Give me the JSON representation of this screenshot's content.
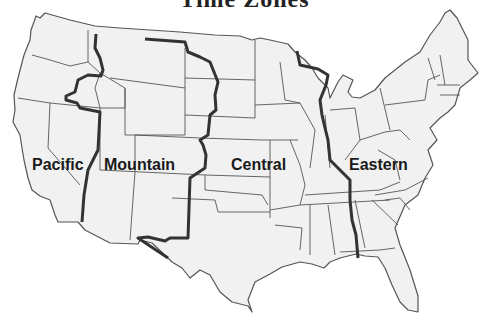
{
  "title": "Time Zones",
  "map": {
    "region": "Contiguous United States",
    "colors": {
      "land": "#f1f1f1",
      "state_border": "#555555",
      "zone_border": "#333333",
      "background": "#ffffff"
    },
    "zones": [
      {
        "id": "pacific",
        "label": "Pacific"
      },
      {
        "id": "mountain",
        "label": "Mountain"
      },
      {
        "id": "central",
        "label": "Central"
      },
      {
        "id": "eastern",
        "label": "Eastern"
      }
    ]
  }
}
